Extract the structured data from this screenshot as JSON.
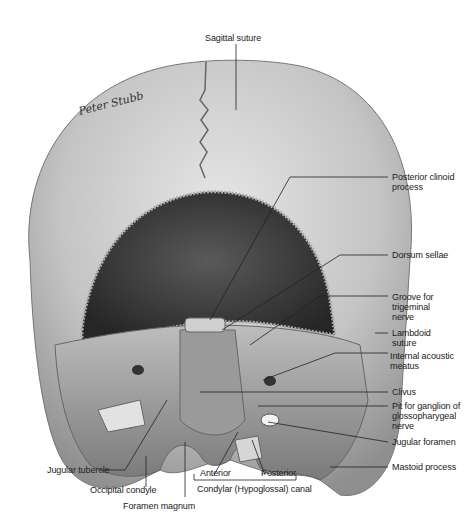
{
  "figure": {
    "view": "Posterior view of cranial base interior",
    "signature": "Peter Stubb",
    "labels": {
      "sagittal_suture": "Sagittal suture",
      "posterior_clinoid_process": "Posterior clinoid\nprocess",
      "dorsum_sellae": "Dorsum sellae",
      "groove_trigeminal": "Groove for\ntrigeminal\nnerve",
      "lambdoid_suture": "Lambdoid\nsuture",
      "internal_acoustic_meatus": "Internal acoustic\nmeatus",
      "clivus": "Clivus",
      "pit_ganglion": "Pit for ganglion of\nglossopharygeal\nnerve",
      "jugular_foramen": "Jugular foramen",
      "mastoid_process": "Mastoid process",
      "jugular_tubercle": "Jugular tubercle",
      "occipital_condyle": "Occipital condyle",
      "foramen_magnum": "Foramen magnum",
      "anterior": "Anterior",
      "posterior": "Posterior",
      "condylar_canal": "Condylar (Hypoglossal) canal"
    },
    "colors": {
      "bone_light": "#d9d9d9",
      "bone_mid": "#a8a8a8",
      "cavity_dark": "#3a3a3a",
      "leader": "#222222"
    }
  }
}
